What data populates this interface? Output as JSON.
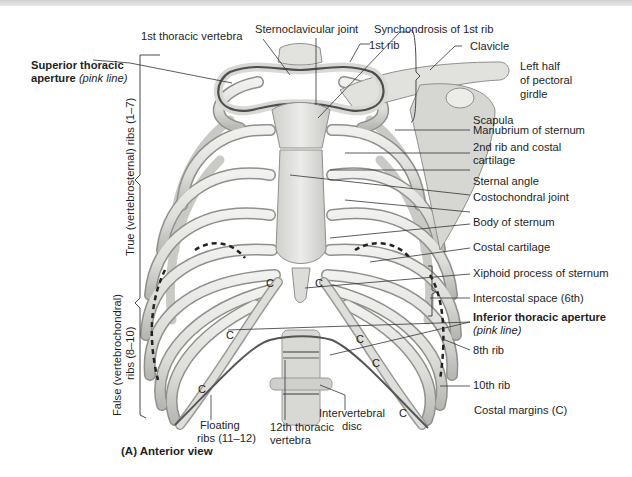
{
  "figure": {
    "caption": "(A) Anterior view",
    "colors": {
      "background": "#ffffff",
      "bone": "#e4e4e1",
      "bone_shadow": "#a9a9a6",
      "bone_outline": "#8c8c8a",
      "aperture_line": "#4e4e4e",
      "leader_line": "#333333",
      "dashed_line": "#222222"
    }
  },
  "labels": {
    "first_thoracic_vertebra": "1st thoracic vertebra",
    "sternoclavicular_joint": "Sternoclavicular joint",
    "synchondrosis_1st_rib": "Synchondrosis of 1st rib",
    "first_rib": "1st rib",
    "clavicle": "Clavicle",
    "pectoral_girdle_line1": "Left half",
    "pectoral_girdle_line2": "of pectoral",
    "pectoral_girdle_line3": "girdle",
    "scapula": "Scapula",
    "manubrium": "Manubrium of sternum",
    "second_rib_line1": "2nd rib and costal",
    "second_rib_line2": "cartilage",
    "sternal_angle": "Sternal angle",
    "costochondral_joint": "Costochondral joint",
    "body_of_sternum": "Body of sternum",
    "costal_cartilage": "Costal cartilage",
    "xiphoid_process": "Xiphoid process of sternum",
    "intercostal_space": "Intercostal space (6th)",
    "inferior_aperture": "Inferior thoracic aperture",
    "inferior_aperture_note": "(pink line)",
    "eighth_rib": "8th rib",
    "tenth_rib": "10th rib",
    "costal_margins": "Costal margins (C)",
    "superior_aperture_line1": "Superior thoracic",
    "superior_aperture_line2": "aperture",
    "superior_aperture_note": "(pink line)",
    "true_ribs": "True (vertebrosternal) ribs (1–7)",
    "false_ribs_line1": "False (vertebrochondral)",
    "false_ribs_line2": "ribs (8–10)",
    "floating_ribs_line1": "Floating",
    "floating_ribs_line2": "ribs (11–12)",
    "twelfth_vertebra_line1": "12th thoracic",
    "twelfth_vertebra_line2": "vertebra",
    "intervertebral_disc_line1": "Intervertebral",
    "intervertebral_disc_line2": "disc",
    "costal_margin_marker": "C"
  }
}
